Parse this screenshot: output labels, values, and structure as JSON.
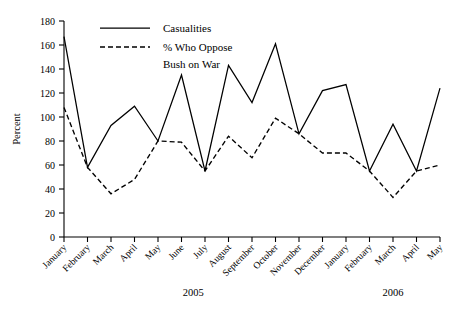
{
  "chart_data": {
    "type": "line",
    "title": "",
    "xlabel": "",
    "ylabel": "Percent",
    "ylim": [
      0,
      180
    ],
    "ytick_step": 20,
    "yticks": [
      0,
      20,
      40,
      60,
      80,
      100,
      120,
      140,
      160,
      180
    ],
    "grid": false,
    "legend_position": "top-center",
    "categories": [
      "January",
      "February",
      "March",
      "April",
      "May",
      "June",
      "July",
      "August",
      "September",
      "October",
      "November",
      "December",
      "January",
      "February",
      "March",
      "April",
      "May"
    ],
    "group_labels": [
      {
        "label": "2005",
        "start_index": 0,
        "end_index": 11
      },
      {
        "label": "2006",
        "start_index": 12,
        "end_index": 16
      }
    ],
    "series": [
      {
        "name": "Casualities",
        "style": "solid",
        "values": [
          167,
          58,
          93,
          109,
          80,
          135,
          55,
          143,
          112,
          161,
          86,
          122,
          127,
          55,
          94,
          55,
          124
        ]
      },
      {
        "name": "% Who Oppose Bush on War",
        "style": "dashed",
        "values": [
          108,
          58,
          36,
          48,
          80,
          79,
          55,
          84,
          66,
          99,
          86,
          70,
          70,
          55,
          33,
          55,
          60
        ]
      }
    ]
  },
  "legend": {
    "entries": [
      {
        "label": "Casualities",
        "style": "solid"
      },
      {
        "label": "% Who Oppose",
        "label_line2": "Bush on War",
        "style": "dashed"
      }
    ]
  },
  "colors": {
    "ink": "#000000",
    "background": "#ffffff"
  }
}
